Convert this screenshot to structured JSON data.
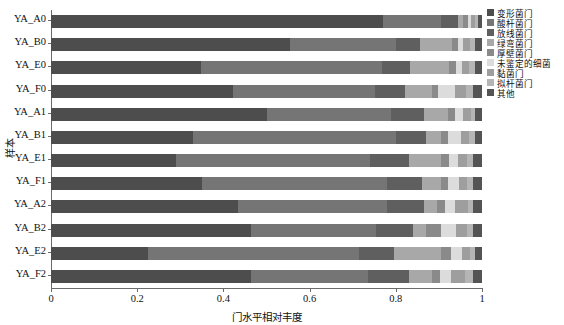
{
  "chart_data": {
    "type": "bar",
    "subtype": "stacked-horizontal-100pct",
    "title": "",
    "xlabel": "门水平相对丰度",
    "ylabel": "样本",
    "xlim": [
      0,
      1
    ],
    "xticks": [
      0,
      0.2,
      0.4,
      0.6,
      0.8,
      1
    ],
    "xtick_labels": [
      "0",
      "0.2",
      "0.4",
      "0.6",
      "0.8",
      "1"
    ],
    "grid": false,
    "legend_position": "right",
    "categories": [
      "YA_A0",
      "YA_B0",
      "YA_E0",
      "YA_F0",
      "YA_A1",
      "YA_B1",
      "YA_E1",
      "YA_F1",
      "YA_A2",
      "YA_B2",
      "YA_E2",
      "YA_F2"
    ],
    "series": [
      {
        "name": "变形菌门",
        "color": "#4d4d4d",
        "values": [
          0.77,
          0.555,
          0.348,
          0.422,
          0.5,
          0.33,
          0.29,
          0.35,
          0.435,
          0.465,
          0.225,
          0.465
        ]
      },
      {
        "name": "酸杆菌门",
        "color": "#757575",
        "values": [
          0.135,
          0.245,
          0.42,
          0.33,
          0.29,
          0.47,
          0.45,
          0.43,
          0.345,
          0.29,
          0.49,
          0.27
        ]
      },
      {
        "name": "放线菌门",
        "color": "#5f5f5f",
        "values": [
          0.04,
          0.055,
          0.065,
          0.07,
          0.075,
          0.07,
          0.09,
          0.08,
          0.085,
          0.085,
          0.08,
          0.095
        ]
      },
      {
        "name": "绿弯菌门",
        "color": "#a8a8a8",
        "values": [
          0.012,
          0.075,
          0.09,
          0.062,
          0.055,
          0.035,
          0.075,
          0.045,
          0.03,
          0.03,
          0.11,
          0.055
        ]
      },
      {
        "name": "厚壁菌门",
        "color": "#8a8a8a",
        "values": [
          0.01,
          0.014,
          0.016,
          0.014,
          0.018,
          0.016,
          0.018,
          0.016,
          0.02,
          0.035,
          0.022,
          0.018
        ]
      },
      {
        "name": "未鉴定的细菌",
        "color": "#dcdcdc",
        "values": [
          0.008,
          0.012,
          0.014,
          0.04,
          0.018,
          0.03,
          0.022,
          0.025,
          0.022,
          0.034,
          0.026,
          0.024
        ]
      },
      {
        "name": "黏菌门",
        "color": "#9e9e9e",
        "values": [
          0.008,
          0.016,
          0.016,
          0.024,
          0.018,
          0.02,
          0.02,
          0.02,
          0.03,
          0.026,
          0.02,
          0.034
        ]
      },
      {
        "name": "拟杆菌门",
        "color": "#b5b5b5",
        "values": [
          0.008,
          0.012,
          0.015,
          0.018,
          0.011,
          0.014,
          0.015,
          0.014,
          0.013,
          0.015,
          0.012,
          0.019
        ]
      },
      {
        "name": "其他",
        "color": "#545454",
        "values": [
          0.009,
          0.016,
          0.016,
          0.02,
          0.015,
          0.015,
          0.02,
          0.02,
          0.02,
          0.02,
          0.015,
          0.02
        ]
      }
    ]
  },
  "axis": {
    "y_title": "样本",
    "x_title": "门水平相对丰度"
  }
}
